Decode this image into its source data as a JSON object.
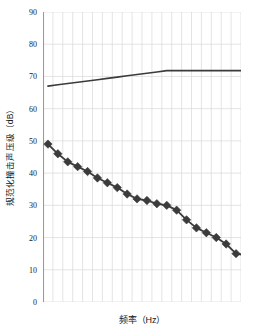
{
  "chart_data": {
    "type": "line",
    "title": "",
    "subtitle": "",
    "xlabel": "频率（Hz）",
    "ylabel": "规范化撞击声压级（dB）",
    "ylim": [
      0,
      90
    ],
    "ytick_step": 10,
    "yticks": [
      90,
      80,
      70,
      60,
      50,
      40,
      30,
      20,
      10,
      0
    ],
    "ytick_labels": [
      "90",
      "80",
      "70",
      "60",
      "50",
      "40",
      "30",
      "20",
      "10",
      "0"
    ],
    "xticks": [],
    "xtick_labels": [],
    "x_gridline_count": 20,
    "grid": {
      "horizontal": true,
      "vertical": true,
      "color": "#d9d9d9"
    },
    "legend": {
      "visible": false,
      "position": "none",
      "entries": []
    },
    "annotations": [],
    "x": [
      1,
      2,
      3,
      4,
      5,
      6,
      7,
      8,
      9,
      10,
      11,
      12,
      13,
      14,
      15,
      16,
      17,
      18,
      19,
      20,
      21
    ],
    "series": [
      {
        "name": "reference-curve",
        "marker": "none",
        "line_color": "#3b3b3b",
        "line_width": 1.6,
        "values": [
          67.0,
          67.4,
          67.8,
          68.2,
          68.6,
          69.0,
          69.4,
          69.8,
          70.2,
          70.6,
          71.0,
          71.4,
          71.8,
          71.8,
          71.8,
          71.8,
          71.8,
          71.8,
          71.8,
          71.8,
          71.8
        ]
      },
      {
        "name": "measured-curve",
        "marker": "filled-diamond",
        "marker_size": 4.2,
        "line_color": "#3b3b3b",
        "marker_color": "#3b3b3b",
        "line_width": 1.8,
        "values": [
          49.0,
          46.0,
          43.5,
          42.0,
          40.5,
          38.5,
          37.0,
          35.5,
          33.5,
          32.0,
          31.5,
          30.5,
          30.0,
          28.5,
          25.5,
          23.0,
          21.5,
          20.0,
          18.0,
          15.0,
          14.5
        ]
      }
    ],
    "series_measured_tail": {
      "name": "measured-curve-tail",
      "values": [
        13.5,
        15.5,
        17.5
      ]
    },
    "colors": {
      "line": "#3b3b3b",
      "marker": "#3b3b3b",
      "grid": "#d9d9d9",
      "axis": "#9a9a9a",
      "background": "#ffffff",
      "text": "#1a1a1a"
    }
  }
}
